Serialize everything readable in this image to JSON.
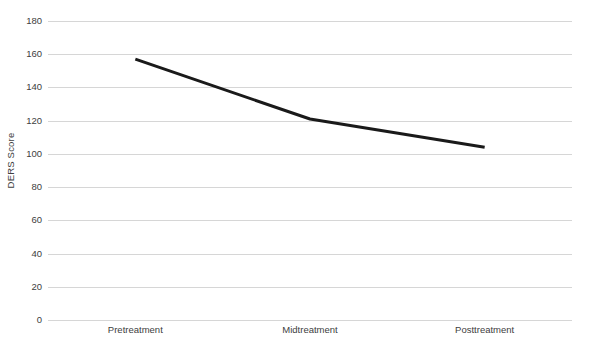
{
  "chart_data": {
    "type": "line",
    "title": "",
    "subtitle": "",
    "xlabel": "",
    "ylabel": "DERS Score",
    "categories": [
      "Pretreatment",
      "Midtreatment",
      "Posttreatment"
    ],
    "values": [
      157,
      121,
      104
    ],
    "series": [
      {
        "name": "DERS Score",
        "values": [
          157,
          121,
          104
        ]
      }
    ],
    "ylim": [
      0,
      180
    ],
    "yticks": [
      0,
      20,
      40,
      60,
      80,
      100,
      120,
      140,
      160,
      180
    ],
    "ytick_labels": [
      "0",
      "20",
      "40",
      "60",
      "80",
      "100",
      "120",
      "140",
      "160",
      "180"
    ],
    "grid": "horizontal",
    "legend": "none",
    "markers": "none",
    "line_color": "#1a1a1a",
    "line_width": 3,
    "gridline_color": "#d6d6d6",
    "background_color": "#ffffff",
    "text_color": "#404040"
  }
}
